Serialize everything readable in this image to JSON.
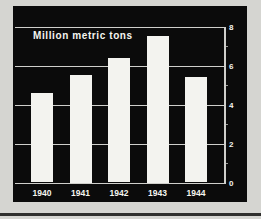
{
  "chart_data": {
    "type": "bar",
    "title": "Million metric tons",
    "categories": [
      "1940",
      "1941",
      "1942",
      "1943",
      "1944"
    ],
    "values": [
      4.6,
      5.5,
      6.4,
      7.5,
      5.4
    ],
    "xlabel": "",
    "ylabel": "Million metric tons",
    "ylim": [
      0,
      8
    ],
    "yticks": [
      0,
      2,
      4,
      6,
      8
    ],
    "minor_yticks": [
      1,
      3,
      5,
      7
    ],
    "grid": "horizontal",
    "axis_side": "right",
    "legend": "none",
    "colors": {
      "page_bg": "#d5d5d1",
      "panel_bg": "#0b0b0b",
      "bar": "#f3f3ef",
      "grid": "#cfcfcb",
      "text": "#f5f5f0",
      "rule": "#2f2f2d"
    }
  }
}
